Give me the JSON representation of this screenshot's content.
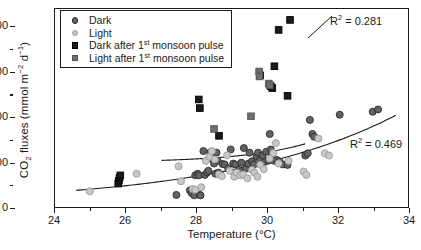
{
  "chart_data": {
    "type": "scatter",
    "title": "",
    "xlabel": "Temperature (°C)",
    "ylabel": "CO2 fluxes (mmol m-2 d-1)",
    "xlim": [
      24,
      34
    ],
    "ylim": [
      0,
      880
    ],
    "xticks": [
      24,
      26,
      28,
      30,
      32,
      34
    ],
    "yticks": [
      0,
      200,
      400,
      600,
      800
    ],
    "x_minor_ticks": [
      25,
      27,
      29,
      31,
      33
    ],
    "y_minor_ticks": [
      100,
      300,
      500,
      700
    ],
    "grid": false,
    "legend_position": "top-left",
    "series": [
      {
        "name": "Dark",
        "marker": "circle",
        "color": "#636363",
        "edge_color": "#2b2b2b",
        "points": [
          [
            27.42,
            62
          ],
          [
            27.8,
            82
          ],
          [
            27.85,
            70
          ],
          [
            27.92,
            60
          ],
          [
            27.95,
            148
          ],
          [
            28.02,
            155
          ],
          [
            28.05,
            148
          ],
          [
            28.08,
            62
          ],
          [
            28.1,
            60
          ],
          [
            28.18,
            255
          ],
          [
            28.22,
            150
          ],
          [
            28.28,
            160
          ],
          [
            28.32,
            168
          ],
          [
            28.38,
            250
          ],
          [
            28.42,
            232
          ],
          [
            28.45,
            216
          ],
          [
            28.48,
            200
          ],
          [
            28.52,
            155
          ],
          [
            28.55,
            248
          ],
          [
            28.58,
            212
          ],
          [
            28.6,
            160
          ],
          [
            28.65,
            152
          ],
          [
            28.72,
            198
          ],
          [
            28.78,
            196
          ],
          [
            28.88,
            178
          ],
          [
            28.95,
            262
          ],
          [
            29.02,
            200
          ],
          [
            29.08,
            196
          ],
          [
            29.18,
            172
          ],
          [
            29.25,
            204
          ],
          [
            29.32,
            268
          ],
          [
            29.38,
            178
          ],
          [
            29.45,
            200
          ],
          [
            29.48,
            248
          ],
          [
            29.55,
            210
          ],
          [
            29.6,
            196
          ],
          [
            29.68,
            232
          ],
          [
            29.72,
            248
          ],
          [
            29.78,
            215
          ],
          [
            29.85,
            236
          ],
          [
            29.92,
            208
          ],
          [
            29.95,
            252
          ],
          [
            30.02,
            213
          ],
          [
            30.05,
            330
          ],
          [
            30.08,
            262
          ],
          [
            30.12,
            240
          ],
          [
            30.18,
            212
          ],
          [
            30.25,
            216
          ],
          [
            30.32,
            210
          ],
          [
            30.42,
            196
          ],
          [
            30.55,
            194
          ],
          [
            31.05,
            235
          ],
          [
            31.12,
            245
          ],
          [
            31.18,
            392
          ],
          [
            31.25,
            330
          ],
          [
            31.3,
            318
          ],
          [
            32.02,
            415
          ],
          [
            32.95,
            428
          ],
          [
            33.1,
            438
          ]
        ]
      },
      {
        "name": "Light",
        "marker": "circle",
        "color": "#c8c8c8",
        "edge_color": "#9a9a9a",
        "points": [
          [
            24.98,
            78
          ],
          [
            26.3,
            155
          ],
          [
            27.48,
            188
          ],
          [
            27.55,
            122
          ],
          [
            27.88,
            88
          ],
          [
            27.95,
            85
          ],
          [
            28.12,
            96
          ],
          [
            28.25,
            212
          ],
          [
            28.35,
            230
          ],
          [
            28.42,
            255
          ],
          [
            28.5,
            218
          ],
          [
            28.62,
            152
          ],
          [
            28.7,
            145
          ],
          [
            28.85,
            236
          ],
          [
            28.92,
            168
          ],
          [
            29.05,
            142
          ],
          [
            29.12,
            160
          ],
          [
            29.22,
            148
          ],
          [
            29.3,
            152
          ],
          [
            29.42,
            135
          ],
          [
            29.55,
            172
          ],
          [
            29.62,
            160
          ],
          [
            29.7,
            142
          ],
          [
            29.78,
            195
          ],
          [
            29.88,
            175
          ],
          [
            30.05,
            222
          ],
          [
            30.15,
            246
          ],
          [
            30.22,
            290
          ],
          [
            30.3,
            200
          ],
          [
            30.58,
            212
          ],
          [
            31.0,
            165
          ],
          [
            31.08,
            150
          ],
          [
            31.42,
            310
          ],
          [
            31.6,
            245
          ],
          [
            31.72,
            235
          ]
        ]
      },
      {
        "name": "Dark after 1st monsoon pulse",
        "marker": "square",
        "color": "#1a1a1a",
        "edge_color": "#000000",
        "points": [
          [
            25.78,
            112
          ],
          [
            25.8,
            125
          ],
          [
            25.82,
            138
          ],
          [
            25.84,
            148
          ],
          [
            28.05,
            482
          ],
          [
            28.08,
            444
          ],
          [
            28.62,
            322
          ],
          [
            29.78,
            588
          ],
          [
            30.08,
            540
          ],
          [
            30.12,
            532
          ],
          [
            30.18,
            628
          ],
          [
            30.3,
            788
          ],
          [
            30.55,
            498
          ],
          [
            30.62,
            832
          ]
        ]
      },
      {
        "name": "Light after 1st monsoon pulse",
        "marker": "square",
        "color": "#6e6e6e",
        "edge_color": "#555555",
        "points": [
          [
            28.48,
            352
          ],
          [
            29.52,
            408
          ],
          [
            29.75,
            605
          ],
          [
            29.76,
            583
          ],
          [
            30.02,
            552
          ],
          [
            30.05,
            545
          ]
        ]
      }
    ],
    "fit_curves": [
      {
        "name": "monsoon-pulse-fit",
        "r2_label": "R2 = 0.281",
        "r2_value": 0.281,
        "x_start": 27.0,
        "x_end": 31.05
      },
      {
        "name": "baseline-fit",
        "r2_label": "R2 = 0.469",
        "r2_value": 0.469,
        "x_start": 24.6,
        "x_end": 33.6
      }
    ]
  },
  "axes": {
    "y_label_prefix": "CO",
    "y_label_sub": "2",
    "y_label_mid": " fluxes (mmol m",
    "y_label_sup1": "−2",
    "y_label_mid2": " d",
    "y_label_sup2": "−1",
    "y_label_suffix": ")",
    "x_label": "Temperature (°C)",
    "ytick_labels": [
      "800",
      "600",
      "400",
      "200",
      "0"
    ],
    "xtick_labels": [
      "24",
      "26",
      "28",
      "30",
      "32",
      "34"
    ]
  },
  "legend": {
    "items": [
      {
        "label": "Dark",
        "marker": "circle",
        "fill": "#636363",
        "stroke": "#2b2b2b"
      },
      {
        "label": "Light",
        "marker": "circle",
        "fill": "#c8c8c8",
        "stroke": "#9a9a9a"
      },
      {
        "label_a": "Dark after 1",
        "label_sup": "st",
        "label_b": " monsoon pulse",
        "marker": "square",
        "fill": "#1a1a1a",
        "stroke": "#000000"
      },
      {
        "label_a": "Light after 1",
        "label_sup": "st",
        "label_b": " monsoon pulse",
        "marker": "square",
        "fill": "#6e6e6e",
        "stroke": "#555555"
      }
    ]
  },
  "annotations": {
    "r2_upper_prefix": "R",
    "r2_upper_sup": "2",
    "r2_upper_value": " = 0.281",
    "r2_lower_prefix": "R",
    "r2_lower_sup": "2",
    "r2_lower_value": " = 0.469"
  }
}
